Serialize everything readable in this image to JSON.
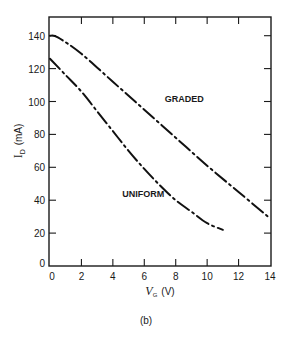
{
  "chart_data": {
    "type": "line",
    "title": "",
    "caption": "(b)",
    "xlabel": "V_G (V)",
    "xlabel_main": "V",
    "xlabel_sub": "G",
    "xlabel_unit": "(V)",
    "ylabel": "I_D (mA)",
    "ylabel_main": "I",
    "ylabel_sub": "D",
    "ylabel_unit": "(mA)",
    "xlim": [
      0,
      14
    ],
    "ylim": [
      0,
      150
    ],
    "xticks": [
      0,
      2,
      4,
      6,
      8,
      10,
      12,
      14
    ],
    "yticks": [
      0,
      20,
      40,
      60,
      80,
      100,
      120,
      140
    ],
    "grid": false,
    "line_style": "dash-dot",
    "series": [
      {
        "name": "GRADED",
        "x": [
          0,
          0.5,
          2,
          4,
          6,
          8,
          10,
          12,
          14
        ],
        "values": [
          140,
          139,
          129,
          112,
          95,
          78,
          61,
          45,
          29
        ],
        "label_pos": [
          7.3,
          100
        ]
      },
      {
        "name": "UNIFORM",
        "x": [
          0,
          1,
          2,
          3,
          4,
          5,
          6,
          7,
          8,
          9,
          10,
          11
        ],
        "values": [
          126,
          116,
          106,
          94,
          82,
          70,
          59,
          49,
          40,
          33,
          26,
          22
        ],
        "label_pos": [
          4.6,
          42
        ]
      }
    ]
  }
}
